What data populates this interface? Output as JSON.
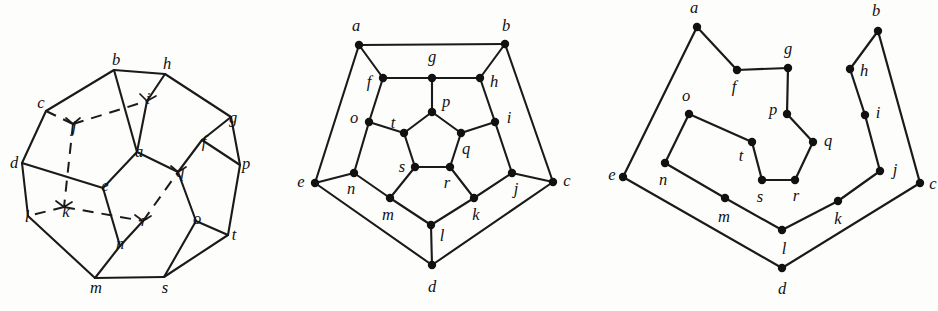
{
  "figure": {
    "ink_color": "#1a1a1a",
    "paper_color": "#fdfdfb",
    "vertex_labels": [
      "a",
      "b",
      "c",
      "d",
      "e",
      "f",
      "g",
      "h",
      "i",
      "j",
      "k",
      "l",
      "m",
      "n",
      "o",
      "p",
      "q",
      "r",
      "s",
      "t"
    ]
  },
  "panels": [
    {
      "name": "solid-dodecahedron",
      "caption": ""
    },
    {
      "name": "planar-graph",
      "caption": ""
    },
    {
      "name": "hamiltonian-cycle",
      "caption": ""
    }
  ],
  "solid": {
    "nodes": {
      "a": {
        "label": "a",
        "x": 137,
        "y": 152,
        "lx": 139,
        "ly": 153
      },
      "b": {
        "label": "b",
        "x": 114,
        "y": 70,
        "lx": 116,
        "ly": 61
      },
      "c": {
        "label": "c",
        "x": 46,
        "y": 111,
        "lx": 41,
        "ly": 104
      },
      "d": {
        "label": "d",
        "x": 22,
        "y": 163,
        "lx": 14,
        "ly": 164
      },
      "e": {
        "label": "e",
        "x": 103,
        "y": 188,
        "lx": 105,
        "ly": 187
      },
      "f": {
        "label": "f",
        "x": 202,
        "y": 140,
        "lx": 204,
        "ly": 143
      },
      "g": {
        "label": "g",
        "x": 231,
        "y": 117,
        "lx": 233,
        "ly": 119
      },
      "h": {
        "label": "h",
        "x": 165,
        "y": 74,
        "lx": 167,
        "ly": 65
      },
      "i": {
        "label": "i",
        "x": 147,
        "y": 101,
        "lx": 148,
        "ly": 100
      },
      "j": {
        "label": "j",
        "x": 73,
        "y": 124,
        "lx": 74,
        "ly": 128
      },
      "k": {
        "label": "k",
        "x": 64,
        "y": 207,
        "lx": 66,
        "ly": 213
      },
      "l": {
        "label": "l",
        "x": 28,
        "y": 216,
        "lx": 27,
        "ly": 218
      },
      "m": {
        "label": "m",
        "x": 95,
        "y": 278,
        "lx": 96,
        "ly": 289
      },
      "n": {
        "label": "n",
        "x": 120,
        "y": 246,
        "lx": 120,
        "ly": 245
      },
      "o": {
        "label": "o",
        "x": 196,
        "y": 221,
        "lx": 197,
        "ly": 220
      },
      "p": {
        "label": "p",
        "x": 240,
        "y": 165,
        "lx": 246,
        "ly": 165
      },
      "q": {
        "label": "q",
        "x": 178,
        "y": 172,
        "lx": 180,
        "ly": 173
      },
      "r": {
        "label": "r",
        "x": 143,
        "y": 221,
        "lx": 144,
        "ly": 222
      },
      "s": {
        "label": "s",
        "x": 164,
        "y": 277,
        "lx": 165,
        "ly": 289
      },
      "t": {
        "label": "t",
        "x": 228,
        "y": 235,
        "lx": 234,
        "ly": 236
      }
    }
  },
  "planar": {
    "nodes": {
      "a": {
        "label": "a",
        "x": 69,
        "y": 45,
        "lx": 66,
        "ly": 27
      },
      "b": {
        "label": "b",
        "x": 215,
        "y": 44,
        "lx": 216,
        "ly": 27
      },
      "c": {
        "label": "c",
        "x": 263,
        "y": 182,
        "lx": 277,
        "ly": 182
      },
      "d": {
        "label": "d",
        "x": 142,
        "y": 265,
        "lx": 142,
        "ly": 288
      },
      "e": {
        "label": "e",
        "x": 25,
        "y": 183,
        "lx": 11,
        "ly": 183
      },
      "f": {
        "label": "f",
        "x": 93,
        "y": 78,
        "lx": 79,
        "ly": 83
      },
      "g": {
        "label": "g",
        "x": 142,
        "y": 78,
        "lx": 142,
        "ly": 58
      },
      "h": {
        "label": "h",
        "x": 190,
        "y": 78,
        "lx": 204,
        "ly": 83
      },
      "i": {
        "label": "i",
        "x": 205,
        "y": 122,
        "lx": 219,
        "ly": 119
      },
      "j": {
        "label": "j",
        "x": 222,
        "y": 173,
        "lx": 226,
        "ly": 190
      },
      "k": {
        "label": "k",
        "x": 184,
        "y": 198,
        "lx": 186,
        "ly": 216
      },
      "l": {
        "label": "l",
        "x": 141,
        "y": 225,
        "lx": 152,
        "ly": 237
      },
      "m": {
        "label": "m",
        "x": 100,
        "y": 198,
        "lx": 98,
        "ly": 216
      },
      "n": {
        "label": "n",
        "x": 64,
        "y": 173,
        "lx": 61,
        "ly": 190
      },
      "o": {
        "label": "o",
        "x": 79,
        "y": 122,
        "lx": 64,
        "ly": 119
      },
      "p": {
        "label": "p",
        "x": 142,
        "y": 112,
        "lx": 156,
        "ly": 103
      },
      "q": {
        "label": "q",
        "x": 171,
        "y": 133,
        "lx": 176,
        "ly": 150
      },
      "r": {
        "label": "r",
        "x": 160,
        "y": 167,
        "lx": 157,
        "ly": 184
      },
      "s": {
        "label": "s",
        "x": 125,
        "y": 167,
        "lx": 112,
        "ly": 168
      },
      "t": {
        "label": "t",
        "x": 114,
        "y": 133,
        "lx": 103,
        "ly": 124
      }
    },
    "edges": [
      [
        "a",
        "b"
      ],
      [
        "a",
        "f"
      ],
      [
        "a",
        "e"
      ],
      [
        "b",
        "h"
      ],
      [
        "b",
        "c"
      ],
      [
        "c",
        "j"
      ],
      [
        "c",
        "d"
      ],
      [
        "d",
        "l"
      ],
      [
        "d",
        "e"
      ],
      [
        "e",
        "n"
      ],
      [
        "f",
        "g"
      ],
      [
        "f",
        "o"
      ],
      [
        "g",
        "h"
      ],
      [
        "g",
        "p"
      ],
      [
        "h",
        "i"
      ],
      [
        "i",
        "j"
      ],
      [
        "i",
        "q"
      ],
      [
        "j",
        "k"
      ],
      [
        "k",
        "l"
      ],
      [
        "k",
        "r"
      ],
      [
        "l",
        "m"
      ],
      [
        "m",
        "n"
      ],
      [
        "m",
        "s"
      ],
      [
        "n",
        "o"
      ],
      [
        "o",
        "t"
      ],
      [
        "p",
        "t"
      ],
      [
        "p",
        "q"
      ],
      [
        "q",
        "r"
      ],
      [
        "r",
        "s"
      ],
      [
        "s",
        "t"
      ]
    ]
  },
  "cycle": {
    "nodes": {
      "a": {
        "label": "a",
        "x": 87,
        "y": 27,
        "lx": 84,
        "ly": 9
      },
      "b": {
        "label": "b",
        "x": 268,
        "y": 31,
        "lx": 266,
        "ly": 12
      },
      "c": {
        "label": "c",
        "x": 310,
        "y": 183,
        "lx": 323,
        "ly": 185
      },
      "d": {
        "label": "d",
        "x": 172,
        "y": 268,
        "lx": 172,
        "ly": 290
      },
      "e": {
        "label": "e",
        "x": 13,
        "y": 177,
        "lx": 2,
        "ly": 176
      },
      "f": {
        "label": "f",
        "x": 127,
        "y": 70,
        "lx": 124,
        "ly": 88
      },
      "g": {
        "label": "g",
        "x": 178,
        "y": 68,
        "lx": 178,
        "ly": 50
      },
      "h": {
        "label": "h",
        "x": 240,
        "y": 69,
        "lx": 254,
        "ly": 72
      },
      "i": {
        "label": "i",
        "x": 255,
        "y": 115,
        "lx": 268,
        "ly": 114
      },
      "j": {
        "label": "j",
        "x": 270,
        "y": 171,
        "lx": 285,
        "ly": 171
      },
      "k": {
        "label": "k",
        "x": 228,
        "y": 201,
        "lx": 228,
        "ly": 220
      },
      "l": {
        "label": "l",
        "x": 172,
        "y": 230,
        "lx": 174,
        "ly": 250
      },
      "m": {
        "label": "m",
        "x": 115,
        "y": 198,
        "lx": 114,
        "ly": 218
      },
      "n": {
        "label": "n",
        "x": 55,
        "y": 163,
        "lx": 53,
        "ly": 181
      },
      "o": {
        "label": "o",
        "x": 79,
        "y": 114,
        "lx": 76,
        "ly": 97
      },
      "p": {
        "label": "p",
        "x": 177,
        "y": 114,
        "lx": 163,
        "ly": 111
      },
      "q": {
        "label": "q",
        "x": 203,
        "y": 142,
        "lx": 218,
        "ly": 142
      },
      "r": {
        "label": "r",
        "x": 185,
        "y": 180,
        "lx": 186,
        "ly": 197
      },
      "s": {
        "label": "s",
        "x": 152,
        "y": 180,
        "lx": 150,
        "ly": 198
      },
      "t": {
        "label": "t",
        "x": 142,
        "y": 142,
        "lx": 131,
        "ly": 157
      }
    },
    "path": [
      "a",
      "f",
      "g",
      "p",
      "q",
      "r",
      "s",
      "t",
      "o",
      "n",
      "m",
      "l",
      "k",
      "j",
      "i",
      "h",
      "b",
      "c",
      "d",
      "e",
      "a"
    ]
  }
}
